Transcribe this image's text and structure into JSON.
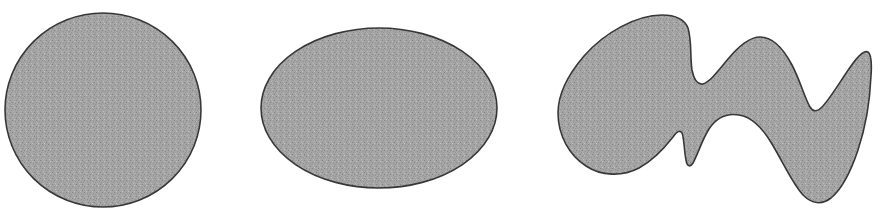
{
  "figure": {
    "background_color": "#ffffff",
    "width": 880,
    "height": 223,
    "caption": ""
  },
  "style": {
    "fill_color": "#a9a9a9",
    "fill_color_light": "#bdbdbd",
    "fill_color_dark": "#949494",
    "outline_color": "#3a3a3a",
    "outline_width": 1.6,
    "texture": "halftone-noise-speckle"
  },
  "shapes": [
    {
      "name": "circle",
      "label": "circle",
      "kind": "ellipse",
      "cx": 103,
      "cy": 110,
      "rx": 98,
      "ry": 97,
      "bbox": {
        "x": 5,
        "y": 13,
        "width": 196,
        "height": 195
      }
    },
    {
      "name": "ellipse",
      "label": "ellipse",
      "kind": "ellipse",
      "cx": 379,
      "cy": 108,
      "rx": 118,
      "ry": 80,
      "bbox": {
        "x": 261,
        "y": 28,
        "width": 236,
        "height": 160
      }
    },
    {
      "name": "irregular-blob",
      "label": "irregular region",
      "kind": "path",
      "bbox": {
        "x": 558,
        "y": 14,
        "width": 314,
        "height": 190
      },
      "path": "M 662 15 C 636 15 604 33 584 56 C 566 77 558 95 558 113 C 558 136 570 156 586 166 C 601 176 622 177 639 168 C 654 160 666 146 673 137 C 677 131 680 130 682 133 C 684 137 684 150 686 160 C 687 166 690 168 693 163 C 698 154 702 140 709 129 C 717 117 727 113 739 115 C 752 117 762 127 772 144 C 784 164 792 183 803 195 C 812 204 822 205 831 198 C 842 189 851 171 858 150 C 866 126 870 100 871 76 C 872 62 871 54 868 52 C 864 50 858 56 851 66 C 841 80 830 99 822 107 C 817 112 813 112 810 107 C 805 99 800 80 792 65 C 782 46 771 37 760 37 C 749 37 738 47 728 59 C 718 71 710 82 703 84 C 698 85 694 80 692 70 C 690 58 692 41 688 28 C 684 18 675 15 662 15 Z"
    }
  ]
}
